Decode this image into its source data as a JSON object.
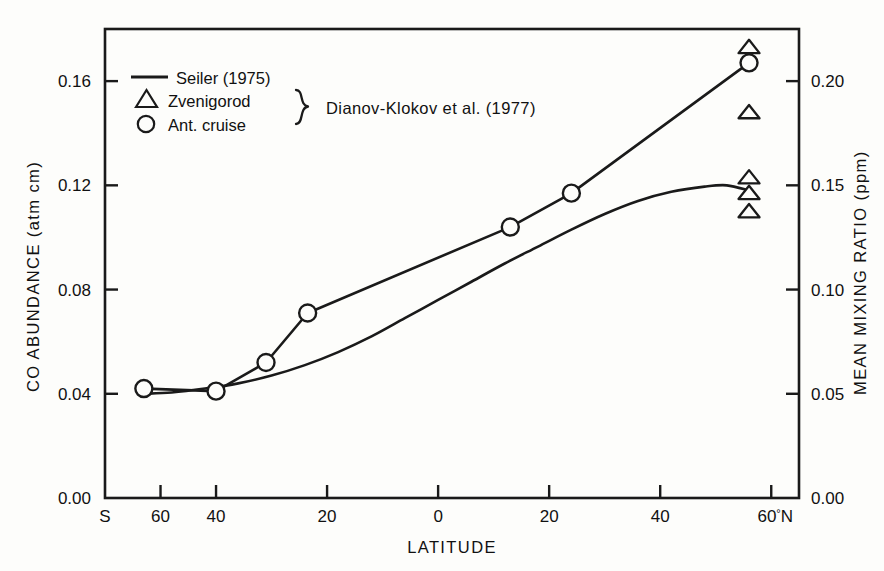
{
  "chart_data": {
    "type": "line",
    "title": "",
    "xlabel": "LATITUDE",
    "ylabel": "CO ABUNDANCE  (atm cm)",
    "y2label": "MEAN MIXING RATIO  (ppm)",
    "xlim": [
      -60,
      65
    ],
    "ylim": [
      0.0,
      0.18
    ],
    "y2lim": [
      0.0,
      0.225
    ],
    "grid": false,
    "legend_position": "top-left",
    "x_ticks": [
      {
        "value": -60,
        "label": "S"
      },
      {
        "value": -50,
        "label": "60"
      },
      {
        "value": -40,
        "label": "40"
      },
      {
        "value": -20,
        "label": "20"
      },
      {
        "value": 0,
        "label": "0"
      },
      {
        "value": 20,
        "label": "20"
      },
      {
        "value": 40,
        "label": "40"
      },
      {
        "value": 60,
        "label": "60°N"
      }
    ],
    "x_tick_labels": [
      "S",
      "60",
      "40",
      "20",
      "0",
      "20",
      "40",
      "60°N"
    ],
    "y_ticks": [
      0.0,
      0.04,
      0.08,
      0.12,
      0.16
    ],
    "y_tick_labels": [
      "0.00",
      "0.04",
      "0.08",
      "0.12",
      "0.16"
    ],
    "y2_ticks": [
      0.0,
      0.05,
      0.1,
      0.15,
      0.2
    ],
    "y2_tick_labels": [
      "0.00",
      "0.05",
      "0.10",
      "0.15",
      "0.20"
    ],
    "series": [
      {
        "name": "Seiler (1975)",
        "marker": "none",
        "style": "smooth-line",
        "x": [
          -53,
          -48,
          -42,
          -36,
          -30,
          -24,
          -18,
          -12,
          -6,
          0,
          6,
          12,
          18,
          24,
          30,
          36,
          42,
          48,
          52,
          56
        ],
        "values": [
          0.04,
          0.0405,
          0.042,
          0.044,
          0.047,
          0.051,
          0.056,
          0.062,
          0.069,
          0.076,
          0.083,
          0.09,
          0.0965,
          0.103,
          0.109,
          0.114,
          0.1175,
          0.1195,
          0.12,
          0.118
        ]
      },
      {
        "name": "Ant. cruise",
        "marker": "circle",
        "style": "segmented-line",
        "x": [
          -53,
          -40,
          -31,
          -23.5,
          13,
          24,
          56
        ],
        "values": [
          0.042,
          0.041,
          0.052,
          0.071,
          0.104,
          0.117,
          0.167
        ]
      },
      {
        "name": "Zvenigorod",
        "marker": "triangle",
        "style": "points",
        "x": [
          56,
          56,
          56,
          56,
          56
        ],
        "values": [
          0.173,
          0.148,
          0.123,
          0.117,
          0.11
        ]
      }
    ],
    "annotations": [
      {
        "text": "Dianov-Klokov et al. (1977)",
        "brace": true,
        "applies_to": [
          "Zvenigorod",
          "Ant. cruise"
        ]
      }
    ]
  },
  "legend": {
    "entries": [
      {
        "marker": "line",
        "label": "Seiler (1975)"
      },
      {
        "marker": "triangle",
        "label": "Zvenigorod"
      },
      {
        "marker": "circle",
        "label": "Ant. cruise"
      }
    ],
    "bracket_note": "Dianov-Klokov et al. (1977)"
  },
  "axes": {
    "left_title": "CO ABUNDANCE  (atm cm)",
    "right_title": "MEAN MIXING RATIO  (ppm)",
    "bottom_title": "LATITUDE"
  }
}
